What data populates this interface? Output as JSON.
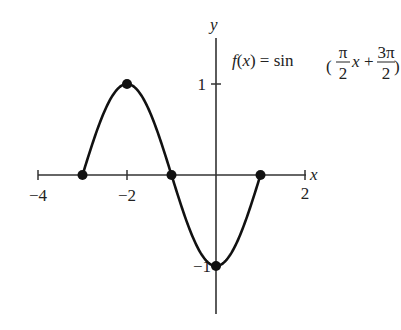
{
  "chart_data": {
    "type": "line",
    "function": "sin(pi/2*x + 3*pi/2)",
    "xlabel": "x",
    "ylabel": "y",
    "xlim": [
      -4,
      2
    ],
    "ylim": [
      -1,
      1
    ],
    "grid": false,
    "x_ticks": [
      -4,
      -2,
      2
    ],
    "y_ticks": [
      1,
      -1
    ],
    "x_tick_labels": [
      "−4",
      "−2",
      "2"
    ],
    "y_tick_labels": [
      "1",
      "−1"
    ],
    "x_domain": [
      -3,
      1
    ],
    "key_points": [
      {
        "x": -3,
        "y": 0
      },
      {
        "x": -2,
        "y": 1
      },
      {
        "x": -1,
        "y": 0
      },
      {
        "x": 0,
        "y": -1
      },
      {
        "x": 1,
        "y": 0
      }
    ],
    "colors": {
      "curve": "#111111",
      "axes": "#333333",
      "points": "#111111"
    }
  },
  "labels": {
    "formula_lhs": "f(x) = sin",
    "pi": "π",
    "two": "2",
    "three_pi": "3π",
    "x_var": "x",
    "plus": "+",
    "x_axis": "x",
    "y_axis": "y",
    "tick_neg4": "−4",
    "tick_neg2": "−2",
    "tick_2": "2",
    "tick_1": "1",
    "tick_neg1": "−1"
  }
}
